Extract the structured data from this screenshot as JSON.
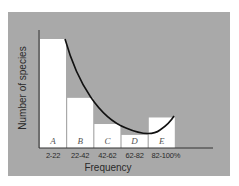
{
  "chart_data": {
    "type": "bar",
    "title": "",
    "xlabel": "Frequency",
    "ylabel": "Number of species",
    "categories": [
      "2-22",
      "22-42",
      "42-62",
      "62-82",
      "82-100%"
    ],
    "bar_labels": [
      "A",
      "B",
      "C",
      "D",
      "E"
    ],
    "values": [
      100,
      46,
      22,
      12,
      28
    ],
    "value_units": "relative height (% of tallest bar, estimated; no y-axis ticks shown)",
    "overlay": {
      "type": "curve",
      "description": "U-shaped smooth curve from top of bar A descending to a minimum near bar D and rising at bar E"
    },
    "ylim": [
      0,
      110
    ],
    "grid": false,
    "legend": null,
    "colors": {
      "background_panel": "#a9a9a9",
      "bars": "#ffffff",
      "curve": "#111111",
      "axes": "#333333"
    }
  }
}
